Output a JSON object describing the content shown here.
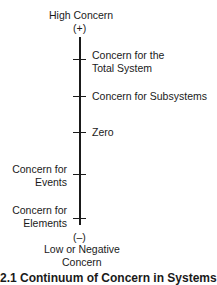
{
  "diagram": {
    "top_label": "High Concern",
    "top_sign": "(+)",
    "bottom_sign": "(–)",
    "bottom_label_line1": "Low or Negative",
    "bottom_label_line2": "Concern",
    "ticks": [
      {
        "line1": "Concern for the",
        "line2": "Total System",
        "side": "right"
      },
      {
        "line1": "Concern for Subsystems",
        "side": "right"
      },
      {
        "line1": "Zero",
        "side": "right"
      },
      {
        "line1": "Concern for",
        "line2": "Events",
        "side": "left"
      },
      {
        "line1": "Concern for",
        "line2": "Elements",
        "side": "left"
      }
    ],
    "caption": "2.1  Continuum of Concern in Systems"
  }
}
